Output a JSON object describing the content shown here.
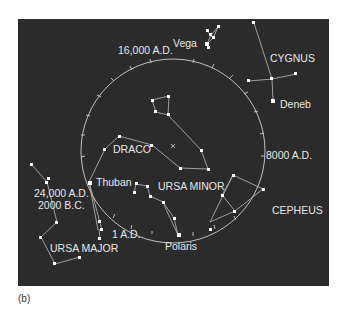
{
  "caption": "(b)",
  "labels": {
    "year_16000": "16,000 A.D.",
    "vega": "Vega",
    "cygnus": "CYGNUS",
    "deneb": "Deneb",
    "draco": "DRACO",
    "year_8000": "8000 A.D.",
    "thuban": "Thuban",
    "ursa_minor": "URSA MINOR",
    "year_24000": "24,000 A.D.",
    "year_2000bc": "2000 B.C.",
    "cepheus": "CEPHEUS",
    "year_1ad": "1 A.D.",
    "ursa_major": "URSA MAJOR",
    "polaris": "Polaris"
  },
  "colors": {
    "background": "#2b2b2b",
    "stars": "#ffffff",
    "lines": "#bdbdbd",
    "text": "#e8e8e8"
  },
  "precession_circle": {
    "center_marker": "×"
  }
}
